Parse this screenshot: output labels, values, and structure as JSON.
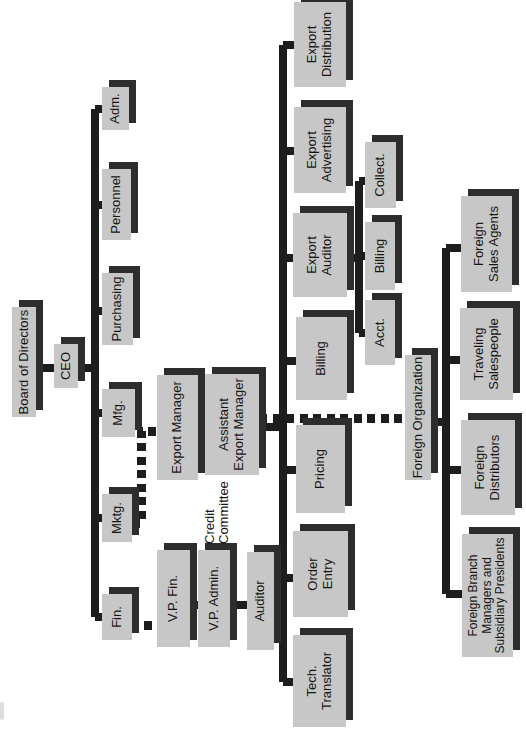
{
  "diagram": {
    "colors": {
      "background": "#ffffff",
      "box_fill": "#c7c7c7",
      "box_shadow": "#2d2d2d",
      "line": "#1d1d1d",
      "text": "#141414"
    },
    "nodes": {
      "board": {
        "label": "Board of Directors",
        "lines": [
          "Board of Directors"
        ]
      },
      "ceo": {
        "label": "CEO",
        "lines": [
          "CEO"
        ]
      },
      "fin": {
        "label": "Fin.",
        "lines": [
          "Fin."
        ]
      },
      "mktg": {
        "label": "Mktg.",
        "lines": [
          "Mktg."
        ]
      },
      "mfg": {
        "label": "Mfg.",
        "lines": [
          "Mfg."
        ]
      },
      "purchasing": {
        "label": "Purchasing",
        "lines": [
          "Purchasing"
        ]
      },
      "personnel": {
        "label": "Personnel",
        "lines": [
          "Personnel"
        ]
      },
      "adm": {
        "label": "Adm.",
        "lines": [
          "Adm."
        ]
      },
      "export_manager": {
        "label": "Export Manager",
        "lines": [
          "Export Manager"
        ]
      },
      "vp_fin": {
        "label": "V.P. Fin.",
        "lines": [
          "V.P. Fin."
        ]
      },
      "assistant_export_manager": {
        "label": "Assistant Export Manager",
        "lines": [
          "Assistant",
          "Export Manager"
        ]
      },
      "credit_committee": {
        "label": "Credit Committee",
        "lines": [
          "Credit",
          "Committee"
        ]
      },
      "vp_admin": {
        "label": "V.P. Admin.",
        "lines": [
          "V.P. Admin."
        ]
      },
      "auditor": {
        "label": "Auditor",
        "lines": [
          "Auditor"
        ]
      },
      "tech_translator": {
        "label": "Tech. Translator",
        "lines": [
          "Tech.",
          "Translator"
        ]
      },
      "order_entry": {
        "label": "Order Entry",
        "lines": [
          "Order",
          "Entry"
        ]
      },
      "pricing": {
        "label": "Pricing",
        "lines": [
          "Pricing"
        ]
      },
      "billing": {
        "label": "Billing",
        "lines": [
          "Billing"
        ]
      },
      "export_auditor": {
        "label": "Export Auditor",
        "lines": [
          "Export",
          "Auditor"
        ]
      },
      "export_advertising": {
        "label": "Export Advertising",
        "lines": [
          "Export",
          "Advertising"
        ]
      },
      "export_distribution": {
        "label": "Export Distribution",
        "lines": [
          "Export",
          "Distribution"
        ]
      },
      "acct": {
        "label": "Acct.",
        "lines": [
          "Acct."
        ]
      },
      "billing_sub": {
        "label": "Billing",
        "lines": [
          "Billing"
        ]
      },
      "collect": {
        "label": "Collect.",
        "lines": [
          "Collect."
        ]
      },
      "foreign_organization": {
        "label": "Foreign Organization",
        "lines": [
          "Foreign Organization"
        ]
      },
      "foreign_sales_agents": {
        "label": "Foreign Sales Agents",
        "lines": [
          "Foreign",
          "Sales Agents"
        ]
      },
      "traveling_salespeople": {
        "label": "Traveling Salespeople",
        "lines": [
          "Traveling",
          "Salespeople"
        ]
      },
      "foreign_distributors": {
        "label": "Foreign Distributors",
        "lines": [
          "Foreign",
          "Distributors"
        ]
      },
      "foreign_branch_managers": {
        "label": "Foreign Branch Managers and Subsidiary Presidents",
        "lines": [
          "Foreign Branch",
          "Managers and",
          "Subsidiary Presidents"
        ]
      }
    }
  }
}
